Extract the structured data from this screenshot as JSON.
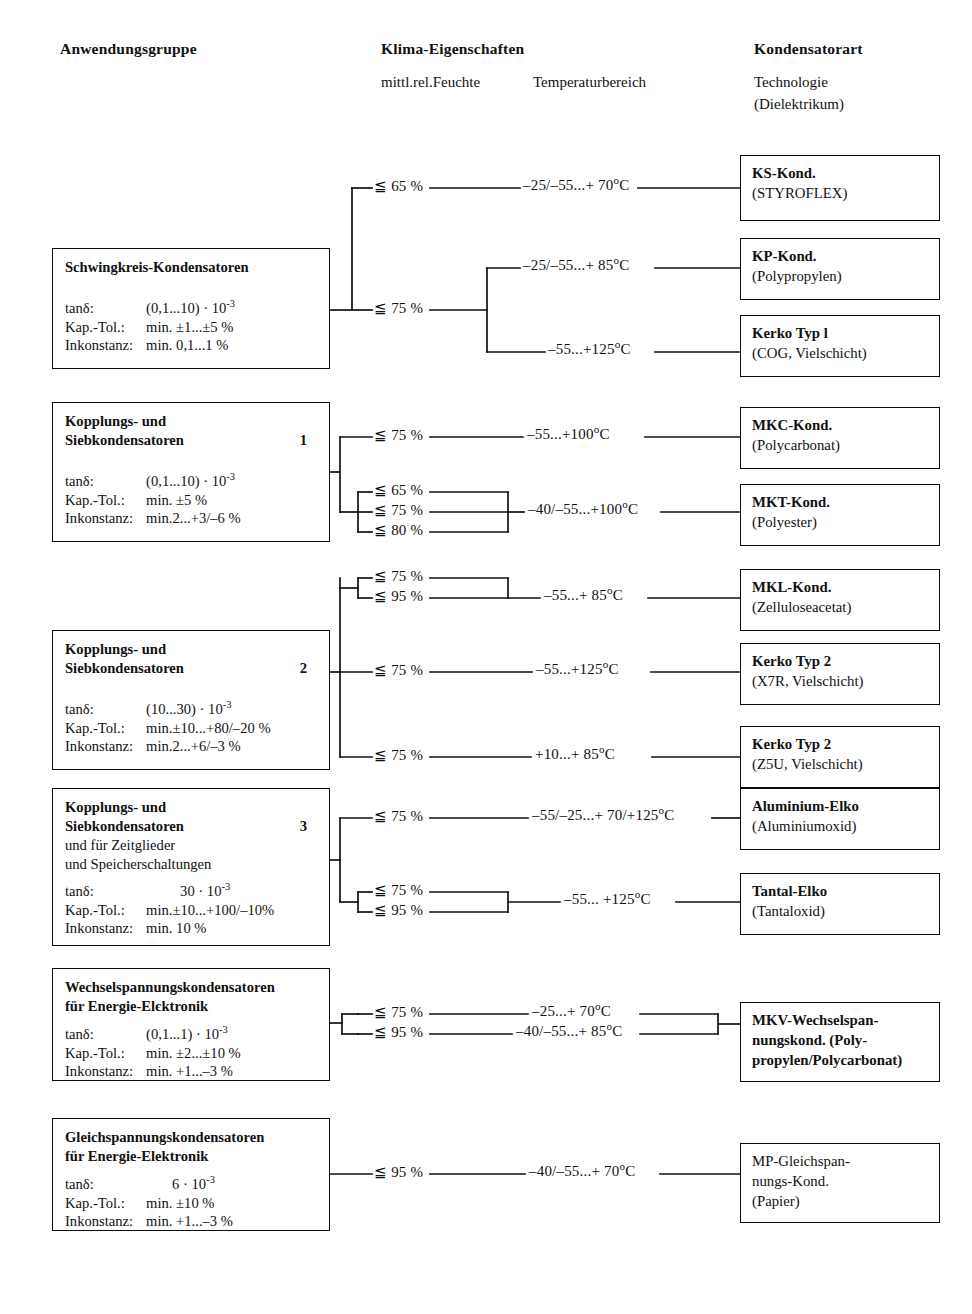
{
  "headers": {
    "left": "Anwendungsgruppe",
    "middle_main": "Klima-Eigenschaften",
    "middle_sub1": "mittl.rel.Feuchte",
    "middle_sub2": "Temperaturbereich",
    "right_main": "Kondensatorart",
    "right_sub1": "Technologie",
    "right_sub2": "(Dielektrikum)"
  },
  "labels": {
    "tan": "tanδ:",
    "kap": "Kap.-Tol.:",
    "ink": "Inkonstanz:"
  },
  "groups": [
    {
      "id": "schwingkreis",
      "title_lines": [
        "Schwingkreis-Kondensatoren"
      ],
      "index": "",
      "tan_value": "(0,1...10) · 10",
      "tan_exp": "-3",
      "kap_value": "min. ±1...±5 %",
      "ink_value": "min. 0,1...1 %"
    },
    {
      "id": "kopplung-1",
      "title_lines": [
        "Kopplungs- und",
        "Siebkondensatoren"
      ],
      "index": "1",
      "tan_value": "(0,1...10) · 10",
      "tan_exp": "-3",
      "kap_value": "min. ±5 %",
      "ink_value": "min.2...+3/–6 %"
    },
    {
      "id": "kopplung-2",
      "title_lines": [
        "Kopplungs- und",
        "Siebkondensatoren"
      ],
      "index": "2",
      "tan_value": "(10...30) · 10",
      "tan_exp": "-3",
      "kap_value": "min.±10...+80/–20 %",
      "ink_value": "min.2...+6/–3 %"
    },
    {
      "id": "kopplung-3",
      "title_lines": [
        "Kopplungs- und",
        "Siebkondensatoren"
      ],
      "index": "3",
      "extra_lines": [
        "und für Zeitglieder",
        "und Speicherschaltungen"
      ],
      "tan_value": "30 · 10",
      "tan_exp": "-3",
      "kap_value": "min.±10...+100/–10%",
      "ink_value": "min. 10 %"
    },
    {
      "id": "wechselspannung",
      "title_lines": [
        "Wechselspannungskondensatoren",
        "für Energie-Elєktronik"
      ],
      "index": "",
      "tan_value": "(0,1...1) · 10",
      "tan_exp": "-3",
      "kap_value": "min. ±2...±10 %",
      "ink_value": "min. +1...–3 %"
    },
    {
      "id": "gleichspannung",
      "title_lines": [
        "Gleichspannungskondensatoren",
        "für Energie-Elektronik"
      ],
      "index": "",
      "tan_value": "6 · 10",
      "tan_exp": "-3",
      "kap_value": "min. ±10 %",
      "ink_value": "min. +1...–3 %"
    }
  ],
  "humidity": {
    "h65a": "≦ 65 %",
    "h75a": "≦ 75 %",
    "h75b": "≦ 75 %",
    "h65c": "≦ 65 %",
    "h75c": "≦ 75 %",
    "h80c": "≦ 80 %",
    "h75d": "≦ 75 %",
    "h95d": "≦ 95 %",
    "h75e": "≦ 75 %",
    "h75f": "≦ 75 %",
    "h75g": "≦ 75 %",
    "h75h": "≦ 75 %",
    "h95h": "≦ 95 %",
    "h75i": "≦ 75 %",
    "h95i": "≦ 95 %",
    "h95j": "≦ 95 %"
  },
  "temperature": {
    "t_ks": {
      "text": "–25/–55...+  70",
      "unit": "o",
      "suffix": "C"
    },
    "t_kp": {
      "text": "–25/–55...+  85",
      "unit": "o",
      "suffix": "C"
    },
    "t_kerko1": {
      "text": "–55...+125",
      "unit": "o",
      "suffix": "C"
    },
    "t_mkc": {
      "text": "–55...+100",
      "unit": "o",
      "suffix": "C"
    },
    "t_mkt": {
      "text": "–40/–55...+100",
      "unit": "o",
      "suffix": "C"
    },
    "t_mkl": {
      "text": "–55...+  85",
      "unit": "o",
      "suffix": "C"
    },
    "t_kerko2x": {
      "text": "–55...+125",
      "unit": "o",
      "suffix": "C"
    },
    "t_kerko2z": {
      "text": "+10...+  85",
      "unit": "o",
      "suffix": "C"
    },
    "t_alu": {
      "text": "–55/–25...+  70/+125",
      "unit": "o",
      "suffix": "C"
    },
    "t_tantal": {
      "text": "–55... +125",
      "unit": "o",
      "suffix": "C"
    },
    "t_mkv1": {
      "text": "–25...+  70",
      "unit": "o",
      "suffix": "C"
    },
    "t_mkv2": {
      "text": "–40/–55...+  85",
      "unit": "o",
      "suffix": "C"
    },
    "t_mp": {
      "text": "–40/–55...+  70",
      "unit": "o",
      "suffix": "C"
    }
  },
  "technologies": [
    {
      "id": "ks",
      "line1": "KS-Kond.",
      "line2": "(STYROFLEX)"
    },
    {
      "id": "kp",
      "line1": "KP-Kond.",
      "line2": "(Polypropylen)"
    },
    {
      "id": "kerko1",
      "line1": "Kerko Typ l",
      "line2": "(COG, Vielschicht)"
    },
    {
      "id": "mkc",
      "line1": "MKC-Kond.",
      "line2": "(Polycarbonat)"
    },
    {
      "id": "mkt",
      "line1": "MKT-Kond.",
      "line2": "(Polyester)"
    },
    {
      "id": "mkl",
      "line1": "MKL-Kond.",
      "line2": "(Zelluloseacetat)"
    },
    {
      "id": "kerko2x",
      "line1": "Kerko Typ 2",
      "line2": "(X7R, Vielschicht)"
    },
    {
      "id": "kerko2z",
      "line1": "Kerko Typ 2",
      "line2": "(Z5U, Vielschicht)"
    },
    {
      "id": "alu",
      "line1": "Aluminium-Elko",
      "line2": "(Aluminiumoxid)"
    },
    {
      "id": "tantal",
      "line1": "Tantal-Elko",
      "line2": "(Tantaloxid)"
    },
    {
      "id": "mkv",
      "line1": "MKV-Wechselspan-",
      "line2": "nungskond. (Poly-",
      "line3": "propylen/Polycarbonat)"
    },
    {
      "id": "mp",
      "line1": "MP-Gleichspan-",
      "line2": "nungs-Kond.",
      "line3": "(Papier)"
    }
  ],
  "colors": {
    "ink": "#111111",
    "paper": "#ffffff",
    "rule": "#0d0d0d"
  }
}
